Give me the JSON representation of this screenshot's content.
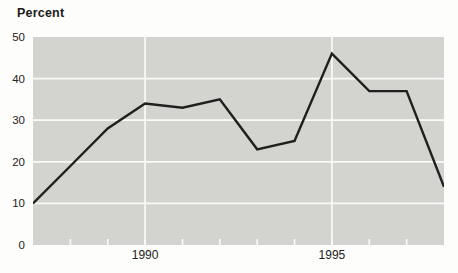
{
  "chart_data": {
    "type": "line",
    "ylabel": "Percent",
    "xlabel": "",
    "x": [
      1987,
      1988,
      1989,
      1990,
      1991,
      1992,
      1993,
      1994,
      1995,
      1996,
      1997,
      1998
    ],
    "values": [
      10,
      19,
      28,
      34,
      33,
      35,
      23,
      25,
      46,
      37,
      37,
      14
    ],
    "xlim": [
      1987,
      1998
    ],
    "ylim": [
      0,
      50
    ],
    "yticks": [
      0,
      10,
      20,
      30,
      40,
      50
    ],
    "xticks_labeled": [
      1990,
      1995
    ],
    "xticks_minor": [
      1988,
      1989,
      1990,
      1991,
      1992,
      1993,
      1994,
      1995,
      1996,
      1997
    ],
    "grid": {
      "horizontal": [
        10,
        20,
        30,
        40
      ],
      "vertical": [
        1990,
        1995
      ]
    },
    "legend": null,
    "colors": {
      "plot_bg": "#d3d3d0",
      "gridline": "#fafaf7",
      "line": "#1f1f1d",
      "text": "#222220",
      "page_bg": "#fdfdfb"
    }
  }
}
